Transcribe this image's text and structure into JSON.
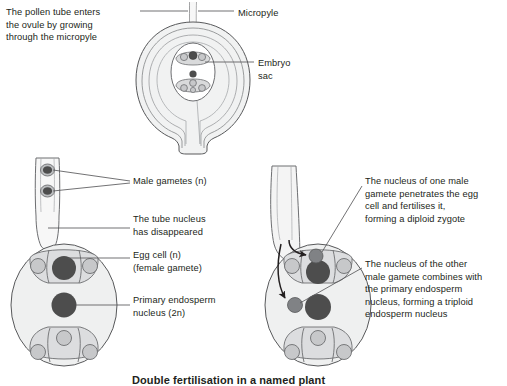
{
  "figure": {
    "caption": "Double fertilisation in a named plant",
    "colors": {
      "outline": "#58595b",
      "nucleus_dark": "#4d4d4d",
      "cell_light": "#c7c8ca",
      "cell_pale": "#e6e7e8",
      "ovule_fill": "#f1f2f2",
      "text": "#231f20",
      "leader_line": "#58595b"
    },
    "labels": {
      "pollen_tube": "The pollen tube enters\nthe ovule by growing\nthrough the micropyle",
      "micropyle": "Micropyle",
      "embryo_sac": "Embryo\nsac",
      "male_gametes": "Male gametes (n)",
      "tube_nucleus": "The tube nucleus\nhas disappeared",
      "egg_cell": "Egg cell (n)\n(female gamete)",
      "primary_endosperm": "Primary endosperm\nnucleus (2n)",
      "one_male_gamete": "The nucleus of one male\ngamete penetrates the egg\ncell and fertilises it,\nforming a diploid zygote",
      "other_male_gamete": "The nucleus of the other\nmale gamete combines with\nthe primary endosperm\nnucleus, forming a triploid\nendosperm nucleus"
    },
    "panels": {
      "top": {
        "name": "ovule-with-pollen-tube",
        "structures": [
          "pollen-tube",
          "integuments",
          "embryo-sac",
          "egg-apparatus",
          "central-nucleus",
          "antipodal-cells",
          "funicle"
        ]
      },
      "bottom_left": {
        "name": "embryo-sac-before-fertilisation",
        "structures": [
          "pollen-tube-tip",
          "male-gamete-1",
          "male-gamete-2",
          "egg-cell",
          "synergid-left",
          "synergid-right",
          "primary-endosperm-nucleus",
          "antipodal-cells"
        ]
      },
      "bottom_right": {
        "name": "embryo-sac-double-fertilisation",
        "structures": [
          "pollen-tube-tip",
          "gamete-path-arrow-1",
          "gamete-path-arrow-2",
          "male-nucleus-at-egg",
          "egg-cell",
          "male-nucleus-at-central",
          "primary-endosperm-nucleus",
          "synergid-left",
          "synergid-right",
          "antipodal-cells"
        ]
      }
    }
  }
}
